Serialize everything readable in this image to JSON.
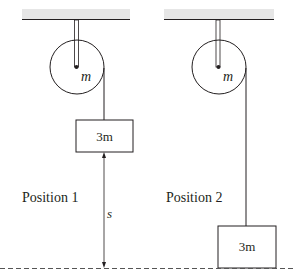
{
  "diagram": {
    "left": {
      "pulley_mass_label": "m",
      "block_label": "3m",
      "position_label": "Position 1",
      "distance_label": "s"
    },
    "right": {
      "pulley_mass_label": "m",
      "block_label": "3m",
      "position_label": "Position 2"
    }
  },
  "colors": {
    "line": "#231f20",
    "ceiling_fill": "#e6e6e6",
    "ground_dash": "#555555"
  }
}
